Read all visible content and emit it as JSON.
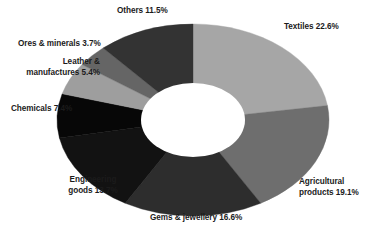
{
  "chart_data": {
    "type": "pie",
    "variant": "donut",
    "title": "",
    "subtitle": "",
    "xlabel": "",
    "ylabel": "",
    "legend_position": "none",
    "grid": false,
    "units": "percent",
    "start_angle_deg": 0,
    "direction": "clockwise",
    "categories": [
      "Textiles",
      "Agricultural products",
      "Gems & jewellery",
      "Engineering goods",
      "Chemicals",
      "Leather & manufactures",
      "Ores & minerals",
      "Others"
    ],
    "values": [
      22.6,
      19.1,
      16.6,
      13.7,
      7.4,
      5.4,
      3.7,
      11.5
    ],
    "colors": [
      "#a6a6a6",
      "#6e6e6e",
      "#2d2d2d",
      "#121212",
      "#070707",
      "#9e9e9e",
      "#656565",
      "#333333"
    ],
    "slices": [
      {
        "label": "Textiles",
        "value": 22.6,
        "color": "#a6a6a6"
      },
      {
        "label": "Agricultural products",
        "value": 19.1,
        "color": "#6e6e6e"
      },
      {
        "label": "Gems & jewellery",
        "value": 16.6,
        "color": "#2d2d2d"
      },
      {
        "label": "Engineering goods",
        "value": 13.7,
        "color": "#121212"
      },
      {
        "label": "Chemicals",
        "value": 7.4,
        "color": "#070707"
      },
      {
        "label": "Leather & manufactures",
        "value": 5.4,
        "color": "#9e9e9e"
      },
      {
        "label": "Ores & minerals",
        "value": 3.7,
        "color": "#656565"
      },
      {
        "label": "Others",
        "value": 11.5,
        "color": "#333333"
      }
    ]
  },
  "labels": {
    "textiles": "Textiles 22.6%",
    "agricultural_line1": "Agricultural",
    "agricultural_line2": "products 19.1%",
    "gems": "Gems & jewellery 16.6%",
    "engineering_line1": "Engineering",
    "engineering_line2": "goods 13.7%",
    "chemicals": "Chemicals 7.4%",
    "leather_line1": "Leather &",
    "leather_line2": "manufactures 5.4%",
    "ores": "Ores & minerals 3.7%",
    "others": "Others 11.5%"
  },
  "style": {
    "background": "#ffffff",
    "text_color": "#1b1b1b",
    "hole_color": "#ffffff"
  }
}
